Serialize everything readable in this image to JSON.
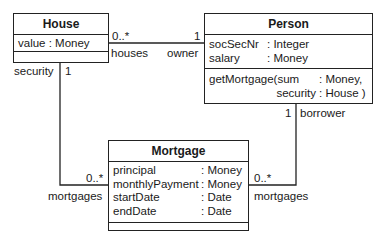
{
  "classes": {
    "house": {
      "name": "House",
      "attributes": [
        {
          "name": "value",
          "type": ": Money"
        }
      ],
      "operations": []
    },
    "person": {
      "name": "Person",
      "attributes": [
        {
          "name": "socSecNr",
          "type": ": Integer"
        },
        {
          "name": "salary",
          "type": ": Money"
        }
      ],
      "operations": [
        {
          "line1_name": "getMortgage(sum",
          "line1_type": ": Money,",
          "line2_name": "security",
          "line2_type": ": House )"
        }
      ]
    },
    "mortgage": {
      "name": "Mortgage",
      "attributes": [
        {
          "name": "principal",
          "type": ": Money"
        },
        {
          "name": "monthlyPayment",
          "type": ": Money"
        },
        {
          "name": "startDate",
          "type": ": Date"
        },
        {
          "name": "endDate",
          "type": ": Date"
        }
      ],
      "operations": []
    }
  },
  "associations": {
    "house_person": {
      "house_mult": "0..*",
      "house_role": "houses",
      "person_mult": "1",
      "person_role": "owner"
    },
    "house_mortgage": {
      "house_role": "security",
      "house_mult": "1",
      "mortgage_mult": "0..*",
      "mortgage_role": "mortgages"
    },
    "person_mortgage": {
      "person_mult": "1",
      "person_role": "borrower",
      "mortgage_mult": "0..*",
      "mortgage_role": "mortgages"
    }
  }
}
